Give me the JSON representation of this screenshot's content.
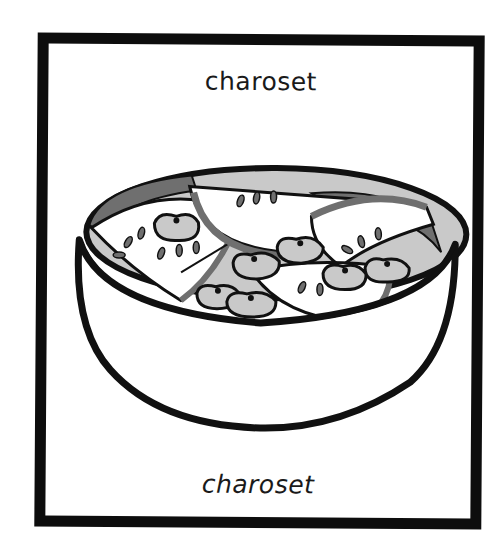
{
  "card": {
    "label_top": "charoset",
    "label_bottom": "charoset",
    "illustration": "bowl-of-charoset-icon"
  },
  "colors": {
    "frame": "#0d0d0d",
    "outline": "#111111",
    "light_fill": "#c9c9c9",
    "dark_fill": "#6f6f6f",
    "background": "#ffffff"
  }
}
